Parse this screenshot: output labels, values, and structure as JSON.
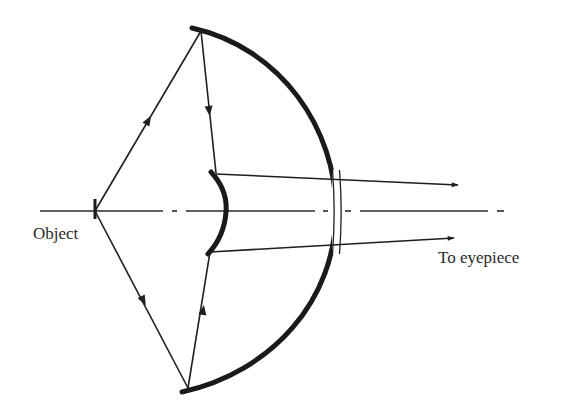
{
  "diagram": {
    "type": "Cassegrain-type catadioptric reflecting telescope ray diagram",
    "labels": {
      "object": "Object",
      "output": "To eyepiece"
    },
    "elements": {
      "object_marker": {
        "x": 95,
        "y1": 199,
        "y2": 219
      },
      "optical_axis": {
        "y": 211,
        "x_start": 40,
        "x_end": 505,
        "style": "dash-dot"
      },
      "primary_mirror": {
        "shape": "arc",
        "top": [
          192,
          28
        ],
        "bottom": [
          182,
          392
        ],
        "apex": [
          336,
          211
        ],
        "thickness": 5
      },
      "secondary_mirror": {
        "shape": "convex arc",
        "top": [
          211,
          172
        ],
        "bottom": [
          208,
          254
        ],
        "apex": [
          226,
          211
        ],
        "thickness": 5
      },
      "transmission_window": {
        "x": 336,
        "y1": 172,
        "y2": 252,
        "style": "double line"
      }
    },
    "rays": [
      {
        "name": "upper-incident",
        "from": [
          95,
          211
        ],
        "to": [
          201,
          31
        ],
        "arrow_at": [
          146,
          124
        ]
      },
      {
        "name": "upper-reflected",
        "from": [
          201,
          31
        ],
        "to": [
          216,
          173
        ],
        "arrow_at": [
          209,
          111
        ]
      },
      {
        "name": "upper-output",
        "from": [
          216,
          174
        ],
        "to": [
          458,
          185
        ]
      },
      {
        "name": "lower-incident",
        "from": [
          95,
          211
        ],
        "to": [
          188,
          388
        ],
        "arrow_at": [
          143,
          301
        ]
      },
      {
        "name": "lower-reflected",
        "from": [
          188,
          388
        ],
        "to": [
          210,
          252
        ],
        "arrow_at": [
          202,
          312
        ]
      },
      {
        "name": "lower-output",
        "from": [
          210,
          252
        ],
        "to": [
          454,
          238
        ]
      }
    ],
    "colors": {
      "ink": "#1e1e1e",
      "background": "#ffffff",
      "text": "#2a2a2a"
    }
  }
}
